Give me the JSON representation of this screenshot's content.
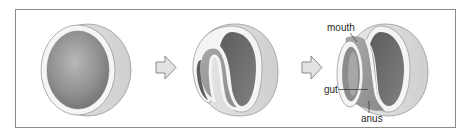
{
  "diagram": {
    "stages": [
      {
        "id": "stage-1",
        "description": "hollow sphere (blastula)"
      },
      {
        "id": "stage-2",
        "description": "invagination begins"
      },
      {
        "id": "stage-3",
        "description": "gut tube formed"
      }
    ],
    "arrows": [
      {
        "from": "stage-1",
        "to": "stage-2"
      },
      {
        "from": "stage-2",
        "to": "stage-3"
      }
    ],
    "labels": {
      "mouth": "mouth",
      "gut": "gut",
      "anus": "anus"
    },
    "colors": {
      "frame": "#8a8a8a",
      "outer_shell": "#d9d9d9",
      "rim": "#f4f4f4",
      "inner_dark": "#6e6e6e",
      "inner_mid": "#9a9a9a",
      "arrow_fill": "#e2e2e2",
      "arrow_stroke": "#8c8c8c"
    }
  }
}
